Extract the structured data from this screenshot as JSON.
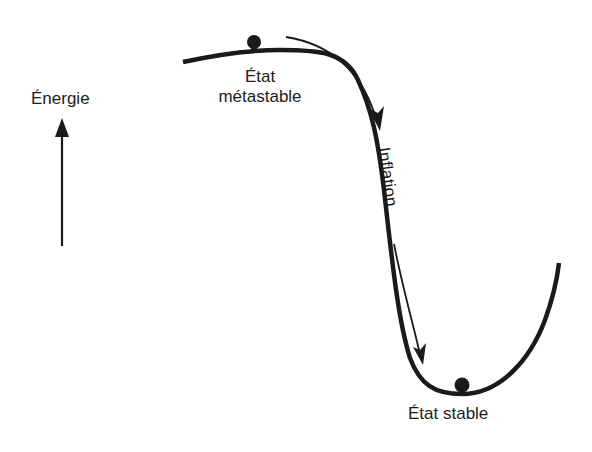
{
  "diagram": {
    "title": "",
    "axis": {
      "label": "Énergie",
      "direction": "up"
    },
    "states": [
      {
        "id": "metastable",
        "label_line1": "État",
        "label_line2": "métastable"
      },
      {
        "id": "stable",
        "label": "État stable"
      }
    ],
    "process": {
      "label": "Inflation"
    },
    "colors": {
      "ink": "#1a1a1a",
      "background": "#ffffff"
    }
  }
}
